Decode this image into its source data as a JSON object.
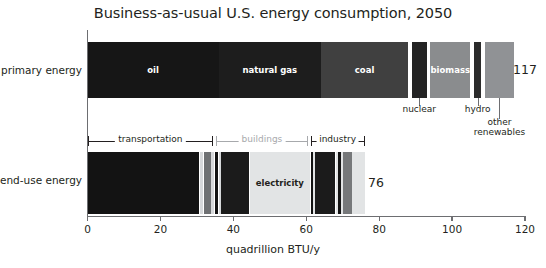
{
  "chart_data": {
    "type": "bar",
    "title": "Business-as-usual U.S. energy consumption, 2050",
    "xlabel": "quadrillion BTU/y",
    "ylabel": "",
    "xlim": [
      0,
      120
    ],
    "xticks": [
      0,
      20,
      40,
      60,
      80,
      100,
      120
    ],
    "xtick_labels": [
      "0",
      "20",
      "40",
      "60",
      "80",
      "100",
      "120"
    ],
    "grid": false,
    "legend": "none",
    "orientation": "horizontal-stacked",
    "units": "quadrillion BTU/y",
    "rows": [
      {
        "name": "primary energy",
        "total": 117,
        "total_label": "117",
        "segments": [
          {
            "label": "oil",
            "value": 36,
            "start": 0,
            "end": 36,
            "color": "#161616",
            "label_inside": true,
            "label_color": "light"
          },
          {
            "label": "natural gas",
            "value": 28,
            "start": 36,
            "end": 64,
            "color": "#1d1d1d",
            "label_inside": true,
            "label_color": "light"
          },
          {
            "label": "coal",
            "value": 24,
            "start": 64,
            "end": 88,
            "color": "#404040",
            "label_inside": true,
            "label_color": "light"
          },
          {
            "label": "nuclear",
            "value": 4,
            "start": 89,
            "end": 93,
            "color": "#242424",
            "label_inside": false,
            "label_color": "dark"
          },
          {
            "label": "biomass",
            "value": 11,
            "start": 94,
            "end": 105,
            "color": "#8a8c8e",
            "label_inside": true,
            "label_color": "light"
          },
          {
            "label": "hydro",
            "value": 2,
            "start": 106,
            "end": 108,
            "color": "#2b2b2b",
            "label_inside": false,
            "label_color": "dark"
          },
          {
            "label": "other renewables",
            "value": 8,
            "start": 109,
            "end": 117,
            "color": "#909295",
            "label_inside": false,
            "label_color": "dark"
          }
        ],
        "callouts": [
          {
            "label": "nuclear",
            "at": 91,
            "lines": [
              "nuclear"
            ]
          },
          {
            "label": "hydro",
            "at": 107,
            "lines": [
              "hydro"
            ]
          },
          {
            "label": "other renewables",
            "at": 113,
            "lines": [
              "other",
              "renewables"
            ]
          }
        ]
      },
      {
        "name": "end-use energy",
        "total": 76,
        "total_label": "76",
        "segments": [
          {
            "label": "",
            "value": 30.5,
            "start": 0,
            "end": 30.5,
            "color": "#131313",
            "label_inside": false,
            "label_color": "light"
          },
          {
            "label": "",
            "value": 0.8,
            "start": 30.9,
            "end": 31.7,
            "color": "#d6d8da",
            "label_inside": false,
            "label_color": "dark"
          },
          {
            "label": "",
            "value": 1.9,
            "start": 31.9,
            "end": 33.8,
            "color": "#6f7173",
            "label_inside": false,
            "label_color": "light"
          },
          {
            "label": "",
            "value": 0.6,
            "start": 34.0,
            "end": 34.6,
            "color": "#d6d8da",
            "label_inside": false,
            "label_color": "dark"
          },
          {
            "label": "",
            "value": 0.8,
            "start": 35.1,
            "end": 35.9,
            "color": "#131313",
            "label_inside": false,
            "label_color": "light"
          },
          {
            "label": "",
            "value": 0.5,
            "start": 36.0,
            "end": 36.5,
            "color": "#d6d8da",
            "label_inside": false,
            "label_color": "dark"
          },
          {
            "label": "",
            "value": 7.6,
            "start": 36.6,
            "end": 44.2,
            "color": "#1b1b1b",
            "label_inside": false,
            "label_color": "light"
          },
          {
            "label": "electricity",
            "value": 16.5,
            "start": 44.5,
            "end": 61.0,
            "color": "#e2e4e5",
            "label_inside": true,
            "label_color": "dark"
          },
          {
            "label": "",
            "value": 0.6,
            "start": 61.2,
            "end": 61.8,
            "color": "#131313",
            "label_inside": false,
            "label_color": "light"
          },
          {
            "label": "",
            "value": 0.4,
            "start": 61.9,
            "end": 62.3,
            "color": "#e2e4e5",
            "label_inside": false,
            "label_color": "dark"
          },
          {
            "label": "",
            "value": 5.6,
            "start": 62.4,
            "end": 68.0,
            "color": "#1b1b1b",
            "label_inside": false,
            "label_color": "light"
          },
          {
            "label": "",
            "value": 0.5,
            "start": 68.2,
            "end": 68.7,
            "color": "#e2e4e5",
            "label_inside": false,
            "label_color": "dark"
          },
          {
            "label": "",
            "value": 0.6,
            "start": 68.8,
            "end": 69.4,
            "color": "#131313",
            "label_inside": false,
            "label_color": "light"
          },
          {
            "label": "",
            "value": 0.5,
            "start": 69.5,
            "end": 70.0,
            "color": "#e2e4e5",
            "label_inside": false,
            "label_color": "dark"
          },
          {
            "label": "",
            "value": 2.4,
            "start": 70.1,
            "end": 72.5,
            "color": "#76787a",
            "label_inside": false,
            "label_color": "light"
          },
          {
            "label": "",
            "value": 3.5,
            "start": 72.6,
            "end": 76.0,
            "color": "#e2e4e5",
            "label_inside": false,
            "label_color": "dark"
          }
        ],
        "brackets": [
          {
            "label": "transportation",
            "start": 0,
            "end": 34.5,
            "color": "dark"
          },
          {
            "label": "buildings",
            "start": 35.2,
            "end": 60.5,
            "color": "grey"
          },
          {
            "label": "industry",
            "start": 61.2,
            "end": 76.0,
            "color": "dark"
          }
        ]
      }
    ]
  },
  "colors": {
    "text": "#231f20",
    "axis": "#6d6e71",
    "muted": "#a7a9ac",
    "background": "#ffffff"
  }
}
